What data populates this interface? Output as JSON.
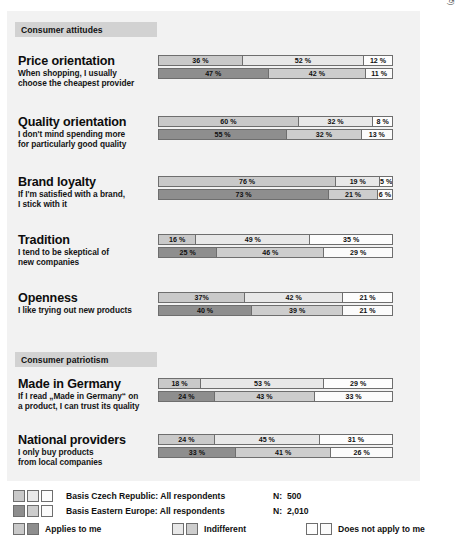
{
  "source_note": "(Source: TNS Infratest/MRSC, 2005)",
  "sections": [
    {
      "id": "consumer-attitudes",
      "label": "Consumer attitudes"
    },
    {
      "id": "consumer-patriotism",
      "label": "Consumer patriotism"
    }
  ],
  "questions": [
    {
      "id": "price-orientation",
      "title": "Price orientation",
      "subtitle": "When shopping, I usually\nchoose the cheapest provider",
      "czech": [
        "36 %",
        "52 %",
        "12 %"
      ],
      "eastern": [
        "47 %",
        "42 %",
        "11 %"
      ]
    },
    {
      "id": "quality-orientation",
      "title": "Quality orientation",
      "subtitle": "I don't mind spending more\nfor particularly good quality",
      "czech": [
        "60 %",
        "32 %",
        "8 %"
      ],
      "eastern": [
        "55 %",
        "32 %",
        "13 %"
      ]
    },
    {
      "id": "brand-loyalty",
      "title": "Brand loyalty",
      "subtitle": "If I'm satisfied with a brand,\nI stick with it",
      "czech": [
        "76 %",
        "19 %",
        "5 %"
      ],
      "eastern": [
        "73 %",
        "21 %",
        "6 %"
      ]
    },
    {
      "id": "tradition",
      "title": "Tradition",
      "subtitle": "I tend to be skeptical of\nnew companies",
      "czech": [
        "16 %",
        "49 %",
        "35 %"
      ],
      "eastern": [
        "25 %",
        "46 %",
        "29 %"
      ]
    },
    {
      "id": "openness",
      "title": "Openness",
      "subtitle": "I like trying out new products",
      "czech": [
        "37%",
        "42 %",
        "21 %"
      ],
      "eastern": [
        "40 %",
        "39 %",
        "21 %"
      ]
    },
    {
      "id": "made-in-germany",
      "title": "Made in Germany",
      "subtitle": "If I read „Made in Germany“ on\na product, I can trust its quality",
      "czech": [
        "18 %",
        "53 %",
        "29 %"
      ],
      "eastern": [
        "24 %",
        "43 %",
        "33 %"
      ]
    },
    {
      "id": "national-providers",
      "title": "National providers",
      "subtitle": "I only buy products\nfrom local companies",
      "czech": [
        "24 %",
        "45 %",
        "31 %"
      ],
      "eastern": [
        "33 %",
        "41 %",
        "26 %"
      ]
    }
  ],
  "legend": {
    "basis": [
      {
        "label": "Basis Czech Republic: All respondents",
        "n_label": "N:",
        "n_value": "500"
      },
      {
        "label": "Basis Eastern Europe: All respondents",
        "n_label": "N:",
        "n_value": "2,010"
      }
    ],
    "keys": [
      {
        "id": "applies",
        "label": "Applies to me"
      },
      {
        "id": "indifferent",
        "label": "Indifferent"
      },
      {
        "id": "does-not-apply",
        "label": "Does not apply to me"
      }
    ]
  },
  "chart_data": {
    "type": "bar",
    "orientation": "horizontal-stacked",
    "xlabel": "",
    "ylabel": "",
    "xlim": [
      0,
      100
    ],
    "grid": false,
    "legend_position": "bottom",
    "categories": [
      "Price orientation",
      "Quality orientation",
      "Brand loyalty",
      "Tradition",
      "Openness",
      "Made in Germany",
      "National providers"
    ],
    "stack_levels": [
      "Applies to me",
      "Indifferent",
      "Does not apply to me"
    ],
    "groups": [
      {
        "name": "Basis Czech Republic: All respondents",
        "n": 500,
        "values": [
          [
            36,
            52,
            12
          ],
          [
            60,
            32,
            8
          ],
          [
            76,
            19,
            5
          ],
          [
            16,
            49,
            35
          ],
          [
            37,
            42,
            21
          ],
          [
            18,
            53,
            29
          ],
          [
            24,
            45,
            31
          ]
        ]
      },
      {
        "name": "Basis Eastern Europe: All respondents",
        "n": 2010,
        "values": [
          [
            47,
            42,
            11
          ],
          [
            55,
            32,
            13
          ],
          [
            73,
            21,
            6
          ],
          [
            25,
            46,
            29
          ],
          [
            40,
            39,
            21
          ],
          [
            24,
            43,
            33
          ],
          [
            33,
            41,
            26
          ]
        ]
      }
    ],
    "annotation": "(Source: TNS Infratest/MRSC, 2005)"
  }
}
